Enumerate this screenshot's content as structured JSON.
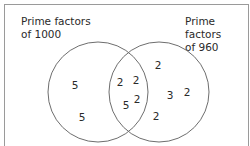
{
  "diagram": {
    "type": "venn",
    "sets": [
      {
        "id": "A",
        "label_line1": "Prime factors",
        "label_line2": "of 1000",
        "only": [
          "5",
          "5"
        ]
      },
      {
        "id": "B",
        "label_line1": "Prime factors",
        "label_line2": "of 960",
        "only": [
          "2",
          "3",
          "2",
          "2"
        ]
      }
    ],
    "intersection": [
      "2",
      "2",
      "2",
      "5"
    ],
    "colors": {
      "stroke": "#6e6e6e",
      "text": "#2a2a2a",
      "frame": "#9a9a9a"
    }
  }
}
